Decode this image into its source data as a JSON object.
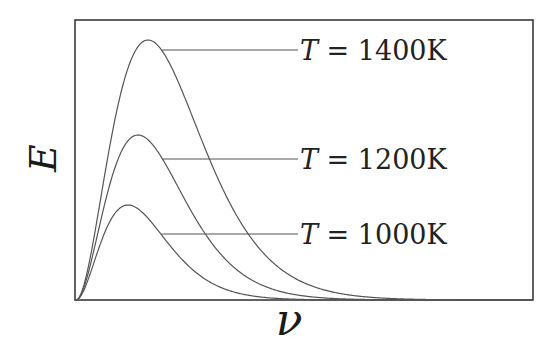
{
  "chart_data": {
    "type": "line",
    "title": "",
    "xlabel": "ν",
    "ylabel": "E",
    "grid": false,
    "ticks": false,
    "legend_position": "inline-right",
    "series": [
      {
        "name": "T = 1400K",
        "var": "T",
        "value": "1400K",
        "peak_x_px": 148,
        "peak_y_px": 40,
        "leader_y_px": 50,
        "leader_start_x_px": 162
      },
      {
        "name": "T = 1200K",
        "var": "T",
        "value": "1200K",
        "peak_x_px": 138,
        "peak_y_px": 135,
        "leader_y_px": 159,
        "leader_start_x_px": 162
      },
      {
        "name": "T = 1000K",
        "var": "T",
        "value": "1000K",
        "peak_x_px": 128,
        "peak_y_px": 205,
        "leader_y_px": 234,
        "leader_start_x_px": 162
      }
    ],
    "plot_box_px": {
      "left": 75,
      "top": 20,
      "right": 533,
      "bottom": 300
    }
  }
}
